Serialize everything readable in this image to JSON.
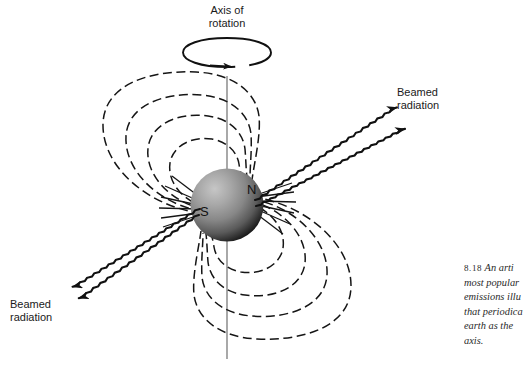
{
  "figure": {
    "labels": {
      "axis_of_rotation_line1": "Axis of",
      "axis_of_rotation_line2": "rotation",
      "beamed_radiation_top_line1": "Beamed",
      "beamed_radiation_top_line2": "radiation",
      "beamed_radiation_bottom_line1": "Beamed",
      "beamed_radiation_bottom_line2": "radiation",
      "pole_north": "N",
      "pole_south": "S"
    },
    "colors": {
      "background": "#ffffff",
      "line": "#141414",
      "axis_line": "#777777",
      "sphere_highlight": "#bdbdbd",
      "sphere_mid": "#8a8a8a",
      "sphere_dark": "#1c1c1c",
      "text": "#1a1a1a",
      "caption_text": "#2a2a2a"
    },
    "caption": {
      "number": "8.18",
      "lines": [
        "An arti",
        "most popular",
        "emissions illu",
        "that periodica",
        "earth as the ",
        "axis."
      ],
      "line1_rest": "An arti"
    }
  }
}
